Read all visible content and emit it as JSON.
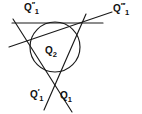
{
  "figure": {
    "type": "geometry-diagram",
    "background_color": "#ffffff",
    "stroke_color": "#1a1a1a",
    "labels": {
      "top_left": {
        "base": "Q",
        "superscript": "′′",
        "subscript": "1"
      },
      "top_right": {
        "base": "Q",
        "superscript": "′′′",
        "subscript": "1"
      },
      "center": {
        "base": "Q",
        "superscript": "",
        "subscript": "2"
      },
      "bottom_left": {
        "base": "Q",
        "superscript": "′",
        "subscript": "1"
      },
      "bottom_right": {
        "base": "Q",
        "superscript": "",
        "subscript": "1"
      }
    },
    "geometry": {
      "circle": {
        "cx": 55,
        "cy": 47,
        "r": 25
      },
      "lines": [
        {
          "name": "horizontal-tangent",
          "x1": 12,
          "y1": 23,
          "x2": 103,
          "y2": 23
        },
        {
          "name": "oblique-rising-line",
          "x1": 9,
          "y1": 47,
          "x2": 112,
          "y2": 12
        },
        {
          "name": "left-descending-line",
          "x1": 13,
          "y1": 19,
          "x2": 72,
          "y2": 112
        },
        {
          "name": "right-descending-line",
          "x1": 86,
          "y1": 14,
          "x2": 44,
          "y2": 110
        }
      ]
    }
  }
}
